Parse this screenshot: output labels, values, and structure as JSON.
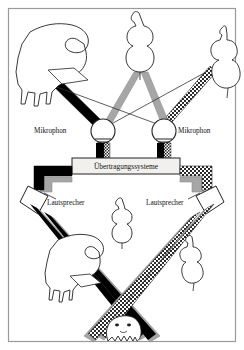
{
  "figure": {
    "border_color": "#9a9a9a",
    "background": "#ffffff"
  },
  "labels": {
    "mic_left": "Mikrophon",
    "mic_right": "Mikrophon",
    "transmission": "Übertragungssysteme",
    "speaker_left": "Lautsprecher",
    "speaker_right": "Lautsprecher"
  },
  "palette": {
    "black_beam": "#000000",
    "gray_beam": "#a6a6a6",
    "hatch_beam": "#2b2b2b",
    "outline": "#222222",
    "border": "#9a9a9a",
    "box_fill": "#f2f0ec"
  },
  "sources": [
    {
      "name": "grand-piano",
      "beam": "black",
      "position": "top-left"
    },
    {
      "name": "cello",
      "beam": "gray",
      "position": "top-center"
    },
    {
      "name": "double-bass",
      "beam": "hatch",
      "position": "top-right"
    }
  ],
  "phantom_images": [
    {
      "name": "phantom-piano",
      "position": "bottom-left"
    },
    {
      "name": "phantom-cello",
      "position": "bottom-center"
    },
    {
      "name": "phantom-bass",
      "position": "bottom-right"
    }
  ],
  "listener": {
    "name": "listener-head",
    "position": "bottom-center"
  }
}
